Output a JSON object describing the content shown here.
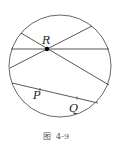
{
  "figure": {
    "caption": "图  4-9",
    "circle": {
      "cx": 60,
      "cy": 66,
      "r": 51
    },
    "point_R": {
      "label": "R",
      "x": 47,
      "y": 49
    },
    "lines_through_R": [
      {
        "x1": 11,
        "y1": 49,
        "x2": 109,
        "y2": 49
      },
      {
        "x1": 21,
        "y1": 33,
        "x2": 109,
        "y2": 85
      },
      {
        "x1": 10,
        "y1": 68,
        "x2": 92,
        "y2": 26
      }
    ],
    "chord_PQ": {
      "x1": 12,
      "y1": 83,
      "x2": 98,
      "y2": 103
    },
    "point_P": {
      "label": "P",
      "x": 40,
      "y": 89.5
    },
    "point_Q": {
      "label": "Q",
      "x": 77,
      "y": 98
    },
    "colors": {
      "stroke": "#444444",
      "point": "#000000"
    }
  }
}
